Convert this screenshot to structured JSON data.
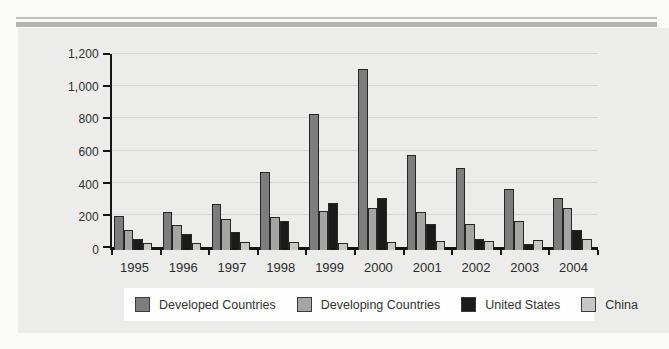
{
  "decor": {
    "thin_rule_color": "#c1c1c0",
    "thick_rule_color": "#b4b4b3",
    "panel_color": "#ececea",
    "grid_color": "#d7d7d5",
    "axis_color": "#141414",
    "legend_background": "#fefefe"
  },
  "chart_data": {
    "type": "bar",
    "title": "",
    "xlabel": "",
    "ylabel": "",
    "ylim": [
      0,
      1200
    ],
    "grid": true,
    "legend_position": "bottom",
    "categories": [
      "1995",
      "1996",
      "1997",
      "1998",
      "1999",
      "2000",
      "2001",
      "2002",
      "2003",
      "2004"
    ],
    "yticks": [
      {
        "value": 0,
        "label": "0"
      },
      {
        "value": 200,
        "label": "200"
      },
      {
        "value": 400,
        "label": "400"
      },
      {
        "value": 600,
        "label": "600"
      },
      {
        "value": 800,
        "label": "800"
      },
      {
        "value": 1000,
        "label": "1,000"
      },
      {
        "value": 1200,
        "label": "1,200"
      }
    ],
    "series": [
      {
        "name": "Developed Countries",
        "color": "#7d7d7d",
        "values": [
          210,
          230,
          280,
          480,
          830,
          1110,
          580,
          500,
          375,
          320
        ]
      },
      {
        "name": "Developing Countries",
        "color": "#a5a5a3",
        "values": [
          125,
          155,
          190,
          205,
          240,
          260,
          230,
          160,
          175,
          260
        ]
      },
      {
        "name": "United States",
        "color": "#1b1b1b",
        "values": [
          65,
          95,
          110,
          180,
          290,
          320,
          160,
          65,
          35,
          125
        ]
      },
      {
        "name": "China",
        "color": "#c7c7c5",
        "values": [
          45,
          45,
          50,
          50,
          45,
          50,
          55,
          55,
          60,
          65
        ]
      }
    ]
  }
}
